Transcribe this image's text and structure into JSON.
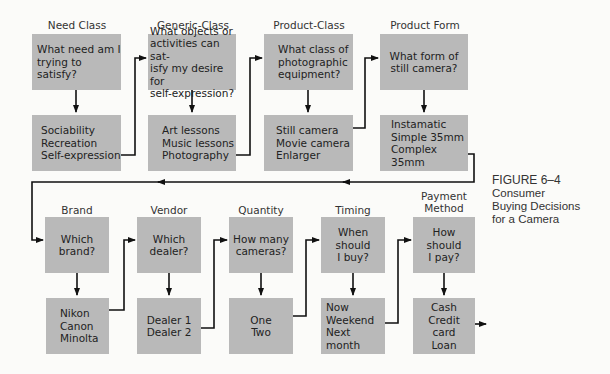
{
  "figure": {
    "number": "FIGURE 6–4",
    "title_lines": [
      "Consumer",
      "Buying Decisions",
      "for a Camera"
    ]
  },
  "row1": [
    {
      "header": "Need Class",
      "question": "What need am I\ntrying to satisfy?",
      "answers": "Sociability\nRecreation\nSelf-expression"
    },
    {
      "header": "Generic-Class",
      "question": "What objects or\nactivities can sat-\nisfy my desire for\nself-expression?",
      "answers": "Art lessons\nMusic lessons\nPhotography"
    },
    {
      "header": "Product-Class",
      "question": "What class of\nphotographic\nequipment?",
      "answers": "Still camera\nMovie camera\nEnlarger"
    },
    {
      "header": "Product Form",
      "question": "What form of\nstill camera?",
      "answers": "Instamatic\nSimple 35mm\nComplex 35mm"
    }
  ],
  "row2": [
    {
      "header": "Brand",
      "question": "Which\nbrand?",
      "answers": "Nikon\nCanon\nMinolta"
    },
    {
      "header": "Vendor",
      "question": "Which\ndealer?",
      "answers": "Dealer 1\nDealer 2"
    },
    {
      "header": "Quantity",
      "question": "How many\ncameras?",
      "answers": "One\nTwo"
    },
    {
      "header": "Timing",
      "question": "When\nshould\nI buy?",
      "answers": "Now\nWeekend\nNext month"
    },
    {
      "header": "Payment\nMethod",
      "question": "How\nshould\nI pay?",
      "answers": "Cash\nCredit\ncard\nLoan"
    }
  ],
  "colors": {
    "box": "#b9b9b9",
    "line": "#111111",
    "background": "#fbfbf9"
  }
}
